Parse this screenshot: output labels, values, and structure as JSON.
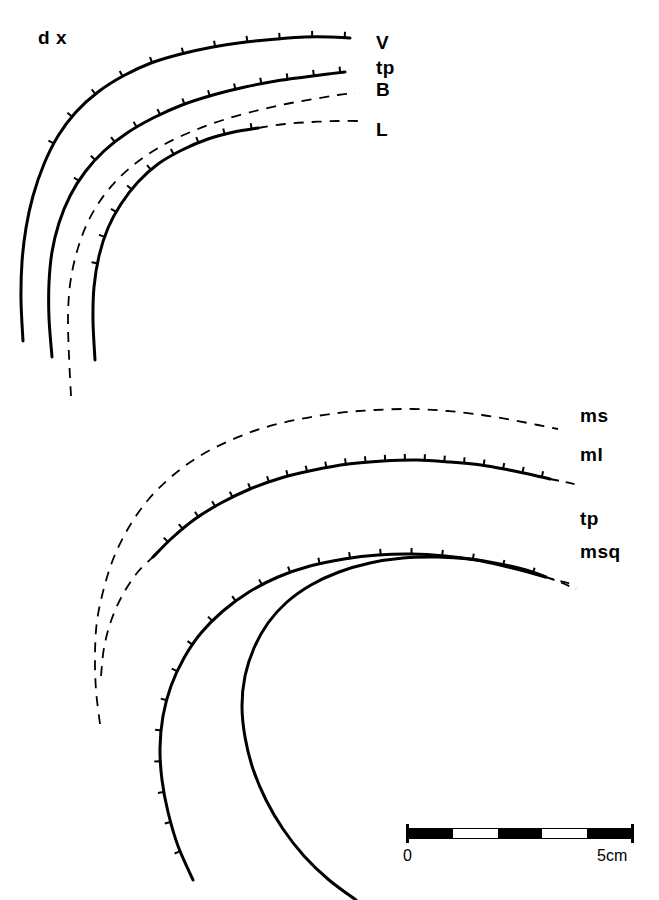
{
  "figure": {
    "side_label": "d x",
    "background_color": "#ffffff",
    "ink_color": "#000000",
    "width": 659,
    "height": 900
  },
  "upper_panel": {
    "labels": [
      {
        "text": "V",
        "x": 376,
        "y": 33
      },
      {
        "text": "tp",
        "x": 376,
        "y": 58
      },
      {
        "text": "B",
        "x": 376,
        "y": 80
      },
      {
        "text": "L",
        "x": 376,
        "y": 120
      }
    ]
  },
  "lower_panel": {
    "labels": [
      {
        "text": "ms",
        "x": 580,
        "y": 406
      },
      {
        "text": "ml",
        "x": 580,
        "y": 445
      },
      {
        "text": "tp",
        "x": 580,
        "y": 509
      },
      {
        "text": "msq",
        "x": 580,
        "y": 542
      }
    ]
  },
  "scalebar": {
    "left_label": "0",
    "right_label": "5cm",
    "x": 407,
    "y": 828,
    "width": 226,
    "height": 11,
    "segments": [
      "#000000",
      "#ffffff",
      "#000000",
      "#ffffff",
      "#000000"
    ],
    "outline_color": "#000000"
  },
  "chart_data": {
    "type": "line",
    "title": "",
    "xlabel": "",
    "ylabel": "",
    "grid": false,
    "legend_position": "right",
    "panels": [
      {
        "name": "upper",
        "side_label": "d x",
        "series": [
          {
            "name": "V",
            "style": "solid",
            "ticked": true,
            "points": [
              [
                23,
                341
              ],
              [
                21,
                300
              ],
              [
                22,
                262
              ],
              [
                26,
                228
              ],
              [
                33,
                196
              ],
              [
                44,
                164
              ],
              [
                58,
                136
              ],
              [
                76,
                112
              ],
              [
                98,
                92
              ],
              [
                123,
                76
              ],
              [
                151,
                63
              ],
              [
                181,
                54
              ],
              [
                213,
                47
              ],
              [
                246,
                42
              ],
              [
                277,
                39
              ],
              [
                305,
                37
              ],
              [
                330,
                37
              ],
              [
                350,
                38
              ]
            ],
            "tick_range": [
              140,
              350
            ],
            "tick_count": 11
          },
          {
            "name": "tp",
            "style": "solid",
            "ticked": true,
            "points": [
              [
                52,
                357
              ],
              [
                49,
                318
              ],
              [
                49,
                283
              ],
              [
                52,
                252
              ],
              [
                59,
                223
              ],
              [
                70,
                196
              ],
              [
                85,
                172
              ],
              [
                104,
                151
              ],
              [
                127,
                133
              ],
              [
                153,
                118
              ],
              [
                182,
                105
              ],
              [
                213,
                95
              ],
              [
                245,
                87
              ],
              [
                276,
                81
              ],
              [
                305,
                77
              ],
              [
                328,
                74
              ],
              [
                345,
                72
              ]
            ],
            "tick_range": [
              95,
              345
            ],
            "tick_count": 12
          },
          {
            "name": "B",
            "style": "dashed",
            "ticked": false,
            "points": [
              [
                71,
                396
              ],
              [
                69,
                356
              ],
              [
                68,
                318
              ],
              [
                70,
                285
              ],
              [
                76,
                255
              ],
              [
                86,
                226
              ],
              [
                100,
                201
              ],
              [
                118,
                179
              ],
              [
                140,
                160
              ],
              [
                165,
                144
              ],
              [
                193,
                131
              ],
              [
                223,
                120
              ],
              [
                255,
                111
              ],
              [
                286,
                104
              ],
              [
                314,
                99
              ],
              [
                338,
                95
              ],
              [
                355,
                93
              ]
            ]
          },
          {
            "name": "L",
            "style": "mixed",
            "ticked": true,
            "solid_points": [
              [
                95,
                360
              ],
              [
                93,
                321
              ],
              [
                94,
                287
              ],
              [
                99,
                256
              ],
              [
                108,
                228
              ],
              [
                121,
                204
              ],
              [
                138,
                182
              ],
              [
                158,
                164
              ],
              [
                182,
                150
              ],
              [
                208,
                139
              ],
              [
                234,
                132
              ],
              [
                258,
                128
              ]
            ],
            "dashed_points": [
              [
                258,
                128
              ],
              [
                285,
                124
              ],
              [
                312,
                122
              ],
              [
                338,
                121
              ],
              [
                360,
                121
              ]
            ],
            "tick_range": [
              110,
              258
            ],
            "tick_count": 9
          }
        ]
      },
      {
        "name": "lower",
        "series": [
          {
            "name": "ms",
            "style": "dashed",
            "ticked": false,
            "points": [
              [
                100,
                724
              ],
              [
                96,
                690
              ],
              [
                95,
                655
              ],
              [
                97,
                621
              ],
              [
                104,
                588
              ],
              [
                114,
                557
              ],
              [
                129,
                527
              ],
              [
                148,
                500
              ],
              [
                171,
                477
              ],
              [
                198,
                457
              ],
              [
                229,
                441
              ],
              [
                263,
                428
              ],
              [
                300,
                419
              ],
              [
                338,
                413
              ],
              [
                375,
                410
              ],
              [
                412,
                409
              ],
              [
                448,
                411
              ],
              [
                482,
                415
              ],
              [
                512,
                420
              ],
              [
                538,
                425
              ],
              [
                558,
                429
              ]
            ]
          },
          {
            "name": "ml",
            "style": "mixed",
            "ticked": true,
            "dashed_points": [
              [
                101,
                676
              ],
              [
                104,
                648
              ],
              [
                111,
                621
              ],
              [
                122,
                596
              ],
              [
                137,
                573
              ],
              [
                153,
                557
              ]
            ],
            "solid_points": [
              [
                153,
                557
              ],
              [
                172,
                538
              ],
              [
                195,
                519
              ],
              [
                221,
                503
              ],
              [
                250,
                489
              ],
              [
                281,
                478
              ],
              [
                314,
                470
              ],
              [
                348,
                464
              ],
              [
                383,
                461
              ],
              [
                417,
                460
              ],
              [
                450,
                462
              ],
              [
                481,
                465
              ],
              [
                509,
                470
              ],
              [
                533,
                475
              ],
              [
                550,
                479
              ]
            ],
            "dash_tail": [
              [
                550,
                479
              ],
              [
                565,
                482
              ],
              [
                578,
                485
              ]
            ],
            "tick_range": [
              153,
              550
            ],
            "tick_count": 21
          },
          {
            "name": "tp",
            "style": "mixed",
            "ticked": true,
            "solid_points": [
              [
                193,
                880
              ],
              [
                178,
                846
              ],
              [
                168,
                812
              ],
              [
                162,
                780
              ],
              [
                160,
                748
              ],
              [
                163,
                716
              ],
              [
                171,
                686
              ],
              [
                184,
                658
              ],
              [
                201,
                633
              ],
              [
                223,
                611
              ],
              [
                249,
                592
              ],
              [
                278,
                577
              ],
              [
                310,
                566
              ],
              [
                344,
                559
              ],
              [
                378,
                555
              ],
              [
                412,
                554
              ],
              [
                445,
                556
              ],
              [
                476,
                560
              ],
              [
                504,
                566
              ],
              [
                528,
                572
              ],
              [
                545,
                577
              ]
            ],
            "dash_tail": [
              [
                545,
                577
              ],
              [
                560,
                581
              ],
              [
                575,
                585
              ]
            ],
            "tick_range": [
              160,
              545
            ],
            "tick_count": 20
          },
          {
            "name": "msq",
            "style": "mixed",
            "ticked": false,
            "solid_points": [
              [
                356,
                900
              ],
              [
                329,
                880
              ],
              [
                304,
                856
              ],
              [
                283,
                829
              ],
              [
                266,
                800
              ],
              [
                253,
                769
              ],
              [
                245,
                737
              ],
              [
                242,
                706
              ],
              [
                245,
                676
              ],
              [
                254,
                648
              ],
              [
                268,
                623
              ],
              [
                287,
                602
              ],
              [
                311,
                585
              ],
              [
                339,
                572
              ],
              [
                370,
                563
              ],
              [
                403,
                558
              ],
              [
                437,
                557
              ],
              [
                470,
                559
              ],
              [
                500,
                564
              ],
              [
                526,
                570
              ],
              [
                546,
                577
              ]
            ],
            "dash_tail": [
              [
                546,
                577
              ],
              [
                562,
                583
              ],
              [
                576,
                589
              ]
            ]
          }
        ]
      }
    ]
  }
}
